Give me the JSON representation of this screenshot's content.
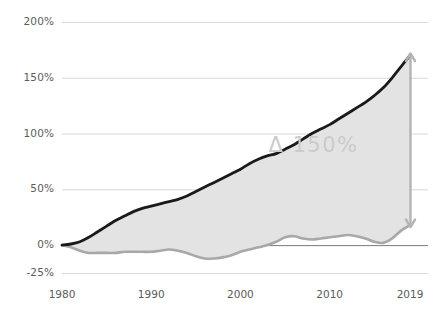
{
  "chart_data": {
    "type": "area",
    "title": "",
    "subtitle": "",
    "xlabel": "",
    "ylabel": "",
    "xlim": [
      1980,
      2019
    ],
    "ylim": [
      -25,
      200
    ],
    "grid": true,
    "legend_position": "none",
    "y_ticks": [
      "200%",
      "150%",
      "100%",
      "50%",
      "0%",
      "-25%"
    ],
    "y_tick_values": [
      200,
      150,
      100,
      50,
      0,
      -25
    ],
    "x_ticks": [
      "1980",
      "1990",
      "2000",
      "2010",
      "2019"
    ],
    "x_tick_values": [
      1980,
      1990,
      2000,
      2010,
      2019
    ],
    "annotations": [
      {
        "text": "Δ 150%",
        "x": 2013,
        "y": 88,
        "color": "#cbcbcb"
      },
      {
        "text": "",
        "type": "double-arrow",
        "x": 2019,
        "y0": 18,
        "y1": 170,
        "color": "#b3b3b3"
      }
    ],
    "colors": {
      "upper_line": "#1a1a1a",
      "lower_line": "#a8a8a8",
      "band_fill": "#e3e3e3",
      "gridline": "#d8d8d8",
      "zero_line": "#7a7a7a",
      "tick_text": "#5b5b5b",
      "annotation": "#cbcbcb"
    },
    "series": [
      {
        "name": "upper",
        "x": [
          1980,
          1981,
          1982,
          1983,
          1984,
          1985,
          1986,
          1987,
          1988,
          1989,
          1990,
          1991,
          1992,
          1993,
          1994,
          1995,
          1996,
          1997,
          1998,
          1999,
          2000,
          2001,
          2002,
          2003,
          2004,
          2005,
          2006,
          2007,
          2008,
          2009,
          2010,
          2011,
          2012,
          2013,
          2014,
          2015,
          2016,
          2017,
          2018,
          2019
        ],
        "values": [
          0,
          1,
          3,
          7,
          12,
          17,
          22,
          26,
          30,
          33,
          35,
          37,
          39,
          41,
          44,
          48,
          52,
          56,
          60,
          64,
          68,
          73,
          77,
          80,
          82,
          86,
          90,
          95,
          100,
          104,
          108,
          113,
          118,
          123,
          128,
          134,
          141,
          150,
          160,
          170
        ]
      },
      {
        "name": "lower",
        "x": [
          1980,
          1981,
          1982,
          1983,
          1984,
          1985,
          1986,
          1987,
          1988,
          1989,
          1990,
          1991,
          1992,
          1993,
          1994,
          1995,
          1996,
          1997,
          1998,
          1999,
          2000,
          2001,
          2002,
          2003,
          2004,
          2005,
          2006,
          2007,
          2008,
          2009,
          2010,
          2011,
          2012,
          2013,
          2014,
          2015,
          2016,
          2017,
          2018,
          2019
        ],
        "values": [
          0,
          -2,
          -5,
          -7,
          -7,
          -7,
          -7,
          -6,
          -6,
          -6,
          -6,
          -5,
          -4,
          -5,
          -7,
          -10,
          -12,
          -12,
          -11,
          -9,
          -6,
          -4,
          -2,
          0,
          3,
          7,
          8,
          6,
          5,
          6,
          7,
          8,
          9,
          8,
          6,
          3,
          2,
          6,
          13,
          18
        ]
      }
    ]
  }
}
